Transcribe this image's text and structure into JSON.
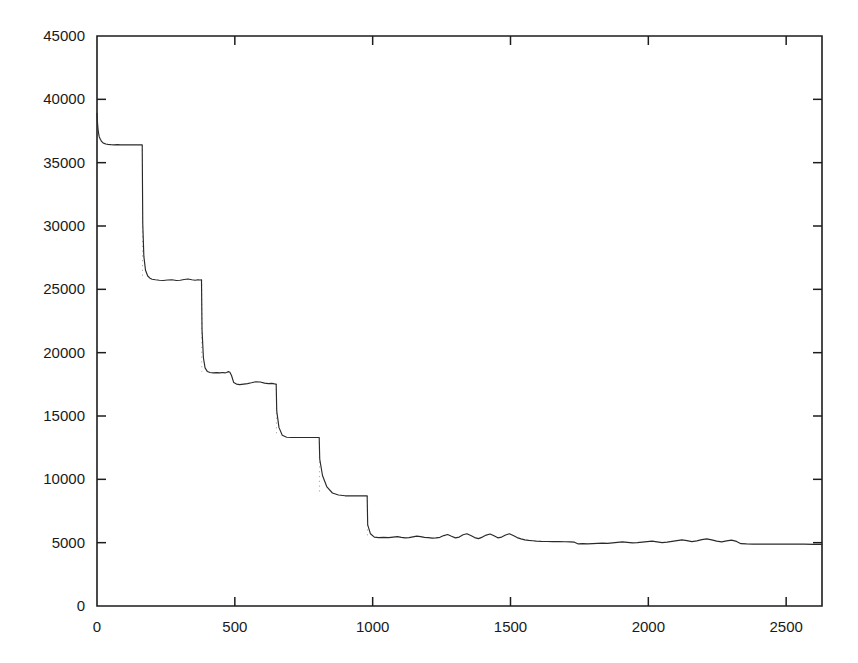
{
  "chart_data": {
    "type": "line",
    "title": "",
    "subtitle": "",
    "xlabel": "",
    "ylabel": "",
    "xlim": [
      0,
      2630
    ],
    "ylim": [
      0,
      45000
    ],
    "grid": false,
    "legend": null,
    "legend_position": "none",
    "annotations": [],
    "x_ticks": [
      0,
      500,
      1000,
      1500,
      2000,
      2500
    ],
    "x_tick_labels": [
      "0",
      "500",
      "1000",
      "1500",
      "2000",
      "2500"
    ],
    "y_ticks": [
      0,
      5000,
      10000,
      15000,
      20000,
      25000,
      30000,
      35000,
      40000,
      45000
    ],
    "y_tick_labels": [
      "0",
      "5000",
      "10000",
      "15000",
      "20000",
      "25000",
      "30000",
      "35000",
      "40000",
      "45000"
    ],
    "series": [
      {
        "name": "cost",
        "color": "#2a2a2a",
        "x": [
          0,
          2,
          4,
          6,
          8,
          12,
          16,
          20,
          26,
          32,
          40,
          50,
          62,
          74,
          86,
          98,
          110,
          122,
          134,
          146,
          158,
          164,
          166,
          170,
          176,
          184,
          192,
          200,
          212,
          226,
          240,
          256,
          272,
          288,
          302,
          316,
          330,
          344,
          356,
          366,
          374,
          379,
          381,
          386,
          392,
          400,
          410,
          422,
          434,
          446,
          456,
          464,
          470,
          474,
          478,
          482,
          488,
          496,
          506,
          518,
          532,
          546,
          560,
          576,
          592,
          608,
          622,
          634,
          644,
          650,
          652,
          660,
          672,
          688,
          706,
          726,
          748,
          770,
          790,
          806,
          808,
          818,
          834,
          854,
          876,
          900,
          926,
          952,
          972,
          980,
          982,
          992,
          1006,
          1022,
          1040,
          1058,
          1074,
          1090,
          1104,
          1118,
          1132,
          1146,
          1160,
          1174,
          1188,
          1202,
          1216,
          1230,
          1244,
          1258,
          1272,
          1286,
          1300,
          1314,
          1328,
          1342,
          1356,
          1370,
          1384,
          1398,
          1412,
          1426,
          1440,
          1454,
          1468,
          1482,
          1496,
          1510,
          1524,
          1538,
          1552,
          1566,
          1580,
          1594,
          1612,
          1632,
          1654,
          1676,
          1698,
          1716,
          1732,
          1746,
          1762,
          1780,
          1798,
          1816,
          1834,
          1852,
          1870,
          1888,
          1906,
          1924,
          1942,
          1960,
          1978,
          1996,
          2014,
          2032,
          2050,
          2068,
          2086,
          2104,
          2122,
          2140,
          2158,
          2176,
          2194,
          2212,
          2230,
          2248,
          2266,
          2284,
          2302,
          2320,
          2336,
          2356,
          2380,
          2410,
          2445,
          2485,
          2525,
          2565,
          2600,
          2630
        ],
        "y": [
          38900,
          38100,
          37600,
          37300,
          37050,
          36850,
          36700,
          36600,
          36520,
          36470,
          36440,
          36420,
          36410,
          36420,
          36410,
          36400,
          36410,
          36400,
          36410,
          36400,
          36400,
          36400,
          30200,
          27600,
          26500,
          26050,
          25880,
          25800,
          25760,
          25720,
          25700,
          25740,
          25760,
          25700,
          25720,
          25780,
          25820,
          25760,
          25720,
          25760,
          25740,
          25760,
          21800,
          19600,
          18800,
          18520,
          18430,
          18400,
          18420,
          18400,
          18430,
          18400,
          18430,
          18480,
          18500,
          18460,
          18200,
          17640,
          17520,
          17480,
          17520,
          17560,
          17620,
          17700,
          17680,
          17600,
          17560,
          17580,
          17540,
          17520,
          15400,
          14100,
          13480,
          13320,
          13300,
          13300,
          13300,
          13300,
          13300,
          13300,
          11600,
          10300,
          9400,
          8920,
          8760,
          8700,
          8700,
          8700,
          8700,
          8700,
          6400,
          5700,
          5440,
          5400,
          5420,
          5400,
          5440,
          5480,
          5420,
          5380,
          5400,
          5460,
          5520,
          5480,
          5420,
          5400,
          5360,
          5380,
          5420,
          5560,
          5640,
          5500,
          5380,
          5440,
          5620,
          5700,
          5560,
          5400,
          5320,
          5440,
          5600,
          5680,
          5540,
          5380,
          5440,
          5600,
          5700,
          5560,
          5400,
          5300,
          5220,
          5180,
          5150,
          5120,
          5100,
          5090,
          5080,
          5080,
          5070,
          5060,
          5040,
          4900,
          4920,
          4900,
          4920,
          4940,
          4960,
          4940,
          4980,
          5020,
          5060,
          5020,
          4980,
          5000,
          5040,
          5080,
          5120,
          5060,
          5000,
          5040,
          5100,
          5160,
          5220,
          5160,
          5080,
          5140,
          5240,
          5300,
          5220,
          5120,
          5060,
          5140,
          5200,
          5100,
          4920,
          4900,
          4890,
          4890,
          4880,
          4890,
          4880,
          4880,
          4870,
          4870
        ]
      }
    ],
    "step_transitions": [
      {
        "x": 165,
        "y_from": 36400,
        "y_to": 25900
      },
      {
        "x": 380,
        "y_from": 25760,
        "y_to": 18500
      },
      {
        "x": 651,
        "y_from": 17520,
        "y_to": 13350
      },
      {
        "x": 807,
        "y_from": 13300,
        "y_to": 8750
      },
      {
        "x": 981,
        "y_from": 8700,
        "y_to": 5420
      }
    ],
    "plateaus": [
      {
        "label": "plateau-1",
        "x_start": 0,
        "x_end": 165,
        "value": 36400
      },
      {
        "label": "plateau-2",
        "x_start": 165,
        "x_end": 380,
        "value": 25750
      },
      {
        "label": "plateau-3",
        "x_start": 380,
        "x_end": 651,
        "value": 18000
      },
      {
        "label": "plateau-4",
        "x_start": 651,
        "x_end": 807,
        "value": 13300
      },
      {
        "label": "plateau-5",
        "x_start": 807,
        "x_end": 981,
        "value": 8700
      },
      {
        "label": "plateau-6",
        "x_start": 981,
        "x_end": 2630,
        "value": 5100
      }
    ]
  },
  "axes": {
    "frame_color": "#1d1d1d",
    "background": "#ffffff",
    "line_color": "#2a2a2a"
  }
}
